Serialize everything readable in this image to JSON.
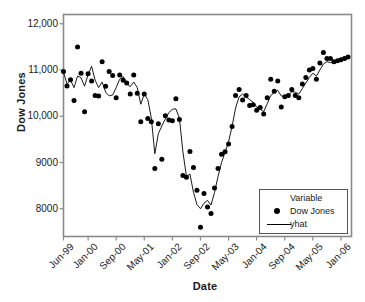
{
  "chart_data": {
    "type": "scatter",
    "title": "",
    "xlabel": "Date",
    "ylabel": "Dow Jones",
    "grid": false,
    "legend_position": "bottom-right",
    "legend_title": "Variable",
    "xlim": [
      0,
      82
    ],
    "ylim": [
      7400,
      12200
    ],
    "ytick_labels": [
      "12,000",
      "11,000",
      "10,000",
      "9000",
      "8000"
    ],
    "ytick_values": [
      12000,
      11000,
      10000,
      9000,
      8000
    ],
    "xtick_labels": [
      "Jun-99",
      "Jan-00",
      "Sep-00",
      "May-01",
      "Jan-02",
      "Sep-02",
      "May-03",
      "Jan-04",
      "Sep-04",
      "May-05",
      "Jan-06"
    ],
    "xtick_values": [
      0,
      7,
      15,
      23,
      31,
      39,
      47,
      55,
      63,
      71,
      79
    ],
    "series": [
      {
        "name": "Dow Jones",
        "marker": "filled-circle",
        "x": [
          0,
          1,
          2,
          3,
          4,
          5,
          6,
          7,
          8,
          9,
          10,
          11,
          12,
          13,
          14,
          15,
          16,
          17,
          18,
          19,
          20,
          21,
          22,
          23,
          24,
          25,
          26,
          27,
          28,
          29,
          30,
          31,
          32,
          33,
          34,
          35,
          36,
          37,
          38,
          39,
          40,
          41,
          42,
          43,
          44,
          45,
          46,
          47,
          48,
          49,
          50,
          51,
          52,
          53,
          54,
          55,
          56,
          57,
          58,
          59,
          60,
          61,
          62,
          63,
          64,
          65,
          66,
          67,
          68,
          69,
          70,
          71,
          72,
          73,
          74,
          75,
          76,
          77,
          78,
          79,
          80,
          81
        ],
        "values": [
          10970,
          10655,
          10790,
          10340,
          11500,
          10930,
          10100,
          10920,
          10760,
          10450,
          10440,
          11180,
          10650,
          10970,
          10880,
          10400,
          10890,
          10780,
          10720,
          10480,
          10890,
          10500,
          9880,
          10480,
          9950,
          9880,
          8870,
          9840,
          9070,
          10010,
          9920,
          9900,
          10380,
          9930,
          8720,
          8680,
          9240,
          8890,
          8400,
          7600,
          8330,
          8040,
          7900,
          8450,
          8870,
          9180,
          9230,
          9400,
          9780,
          10450,
          10580,
          10350,
          10450,
          10230,
          10250,
          10130,
          10190,
          10050,
          10400,
          10800,
          10540,
          10760,
          10200,
          10420,
          10450,
          10580,
          10450,
          10400,
          10700,
          10840,
          11000,
          11030,
          10800,
          11150,
          11380,
          11250,
          11250,
          11180,
          11200,
          11220,
          11250,
          11280
        ]
      },
      {
        "name": "yhat",
        "marker": "line",
        "x": [
          0,
          1,
          2,
          3,
          4,
          5,
          6,
          7,
          8,
          9,
          10,
          11,
          12,
          13,
          14,
          15,
          16,
          17,
          18,
          19,
          20,
          21,
          22,
          23,
          24,
          25,
          26,
          27,
          28,
          29,
          30,
          31,
          32,
          33,
          34,
          35,
          36,
          37,
          38,
          39,
          40,
          41,
          42,
          43,
          44,
          45,
          46,
          47,
          48,
          49,
          50,
          51,
          52,
          53,
          54,
          55,
          56,
          57,
          58,
          59,
          60,
          61,
          62,
          63,
          64,
          65,
          66,
          67,
          68,
          69,
          70,
          71,
          72,
          73,
          74,
          75,
          76,
          77,
          78,
          79,
          80,
          81
        ],
        "values": [
          10950,
          10700,
          10780,
          10620,
          10870,
          10830,
          10650,
          10900,
          11080,
          10780,
          10620,
          10740,
          10520,
          10440,
          10460,
          10620,
          10800,
          10860,
          10700,
          10640,
          10740,
          10620,
          10260,
          10480,
          10360,
          9960,
          9190,
          9620,
          9790,
          9940,
          10080,
          10150,
          10160,
          9960,
          9230,
          8700,
          8750,
          8360,
          8090,
          8000,
          8120,
          8180,
          8080,
          8350,
          8700,
          9000,
          9220,
          9450,
          9780,
          10180,
          10420,
          10480,
          10420,
          10360,
          10300,
          10200,
          10150,
          10100,
          10270,
          10450,
          10510,
          10560,
          10440,
          10420,
          10450,
          10530,
          10520,
          10480,
          10600,
          10720,
          10840,
          10930,
          10870,
          11000,
          11130,
          11180,
          11160,
          11160,
          11180,
          11210,
          11230,
          11250
        ]
      }
    ]
  },
  "axes": {
    "ylabel": "Dow Jones",
    "xlabel": "Date"
  },
  "legend": {
    "title": "Variable",
    "entries": [
      {
        "label": "Dow Jones",
        "key": "dot"
      },
      {
        "label": "yhat",
        "key": "line"
      }
    ]
  }
}
